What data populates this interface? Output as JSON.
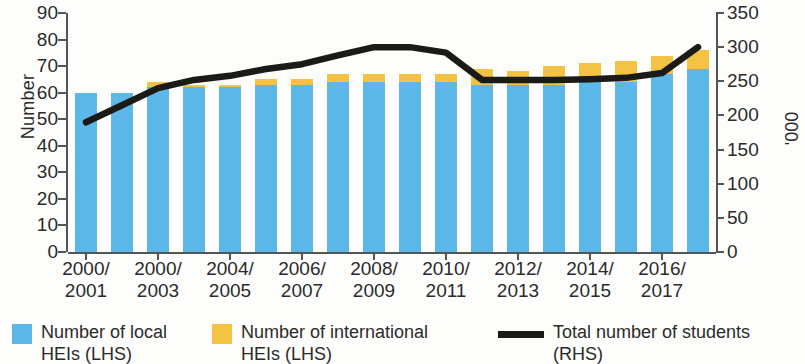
{
  "chart_data": {
    "type": "bar",
    "title": "",
    "subtitle": "",
    "xlabel": "",
    "ylabel": "Number",
    "ylabel_right": "'000",
    "ylim": [
      0,
      90
    ],
    "ylim_right": [
      0,
      350
    ],
    "yticks": [
      0,
      10,
      20,
      30,
      40,
      50,
      60,
      70,
      80,
      90
    ],
    "yticks_right": [
      0,
      50,
      100,
      150,
      200,
      250,
      300,
      350
    ],
    "grid": false,
    "legend_position": "bottom",
    "stacked": true,
    "categories": [
      "2000/2001",
      "2001/2002",
      "2000/2003",
      "2003/2004",
      "2004/2005",
      "2005/2006",
      "2006/2007",
      "2007/2008",
      "2008/2009",
      "2009/2010",
      "2010/2011",
      "2011/2012",
      "2012/2013",
      "2013/2014",
      "2014/2015",
      "2015/2016",
      "2016/2017",
      "2017/2018"
    ],
    "xtick_labels": [
      {
        "index": 0,
        "line1": "2000/",
        "line2": "2001"
      },
      {
        "index": 2,
        "line1": "2000/",
        "line2": "2003"
      },
      {
        "index": 4,
        "line1": "2004/",
        "line2": "2005"
      },
      {
        "index": 6,
        "line1": "2006/",
        "line2": "2007"
      },
      {
        "index": 8,
        "line1": "2008/",
        "line2": "2009"
      },
      {
        "index": 10,
        "line1": "2010/",
        "line2": "2011"
      },
      {
        "index": 12,
        "line1": "2012/",
        "line2": "2013"
      },
      {
        "index": 14,
        "line1": "2014/",
        "line2": "2015"
      },
      {
        "index": 16,
        "line1": "2016/",
        "line2": "2017"
      }
    ],
    "series": [
      {
        "name": "Number of local HEIs (LHS)",
        "axis": "left",
        "type": "bar",
        "color": "#5bb8e8",
        "values": [
          60,
          60,
          62,
          62,
          62,
          63,
          63,
          64,
          64,
          64,
          64,
          63,
          63,
          63,
          64,
          64,
          67,
          69
        ]
      },
      {
        "name": "Number of international HEIs (LHS)",
        "axis": "left",
        "type": "bar",
        "color": "#f5c344",
        "values": [
          0,
          0,
          2,
          1,
          1,
          2,
          2,
          3,
          3,
          3,
          3,
          6,
          5,
          7,
          7,
          8,
          7,
          7
        ]
      },
      {
        "name": "Total number of students (RHS)",
        "axis": "right",
        "type": "line",
        "color": "#1b1a17",
        "values": [
          190,
          215,
          240,
          252,
          258,
          268,
          275,
          288,
          300,
          300,
          292,
          252,
          252,
          252,
          253,
          255,
          262,
          300
        ]
      }
    ]
  },
  "legend": {
    "items": [
      {
        "label": "Number of local\nHEIs  (LHS)",
        "marker": "square",
        "color": "#5bb8e8"
      },
      {
        "label": "Number of international\nHEIs (LHS)",
        "marker": "square",
        "color": "#f5c344"
      },
      {
        "label": "Total number of students\n(RHS)",
        "marker": "line",
        "color": "#1b1a17"
      }
    ]
  }
}
